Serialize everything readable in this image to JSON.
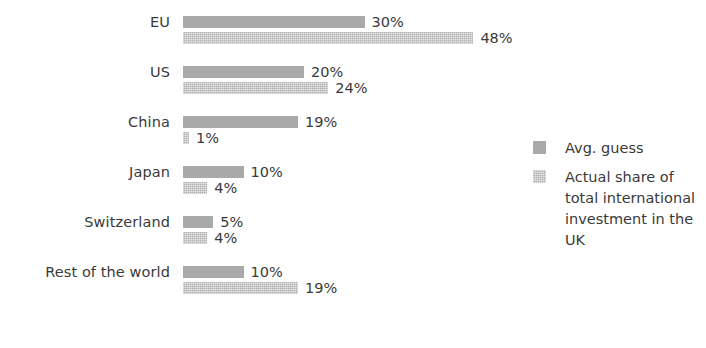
{
  "chart_data": {
    "type": "bar",
    "orientation": "horizontal",
    "title": "",
    "subtitle": "",
    "xlabel": "",
    "ylabel": "",
    "grid": false,
    "xlim": [
      0,
      48
    ],
    "legend_position": "right",
    "value_suffix": "%",
    "categories": [
      "EU",
      "US",
      "China",
      "Japan",
      "Switzerland",
      "Rest of the world"
    ],
    "series": [
      {
        "name": "Avg. guess",
        "color": "#a9a9a9",
        "values": [
          30,
          20,
          19,
          10,
          5,
          10
        ],
        "labels": [
          "30%",
          "20%",
          "19%",
          "10%",
          "5%",
          "10%"
        ]
      },
      {
        "name": "Actual share of total international investment in the UK",
        "color": "#c4c4c4",
        "values": [
          48,
          24,
          1,
          4,
          4,
          19
        ],
        "labels": [
          "48%",
          "24%",
          "1%",
          "4%",
          "4%",
          "19%"
        ]
      }
    ]
  },
  "legend": {
    "entries": [
      {
        "label": "Avg. guess",
        "swatch": "series-guess"
      },
      {
        "label": "Actual share of total international investment in the UK",
        "swatch": "series-actual"
      }
    ]
  }
}
